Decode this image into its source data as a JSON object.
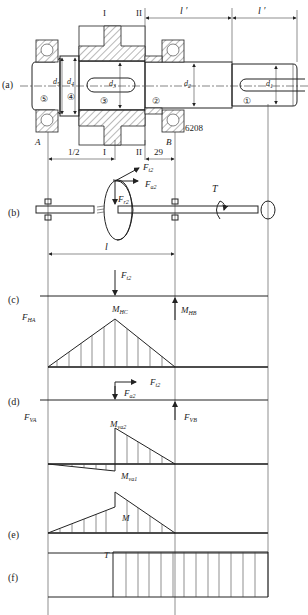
{
  "figure": {
    "panels": [
      {
        "id": "a",
        "label": "(a)"
      },
      {
        "id": "b",
        "label": "(b)"
      },
      {
        "id": "c",
        "label": "(c)"
      },
      {
        "id": "d",
        "label": "(d)"
      },
      {
        "id": "e",
        "label": "(e)"
      },
      {
        "id": "f",
        "label": "(f)"
      }
    ],
    "shaft": {
      "sections": [
        {
          "mark": "I",
          "label": "I"
        },
        {
          "mark": "II",
          "label": "II"
        }
      ],
      "segments": [
        {
          "num": "⑤",
          "dia": "d",
          "sub": "5"
        },
        {
          "num": "④",
          "dia": "d",
          "sub": "4"
        },
        {
          "num": "③",
          "dia": "d",
          "sub": "3"
        },
        {
          "num": "②",
          "dia": "d",
          "sub": "2"
        },
        {
          "num": "①",
          "dia": "d",
          "sub": "1"
        }
      ],
      "bearing_left": "A",
      "bearing_right": "B",
      "bearing_code": "6208",
      "dims": {
        "l_prime_1": "l ′",
        "l_prime_2": "l ′",
        "half_l": "1/2",
        "dist_29": "29",
        "l": "l"
      }
    },
    "forces": {
      "Ft2": {
        "main": "F",
        "sub": "t2"
      },
      "Fa2": {
        "main": "F",
        "sub": "a2"
      },
      "Fr2": {
        "main": "F",
        "sub": "r2"
      },
      "T": "T"
    },
    "horizontal_plane": {
      "reaction_A": {
        "main": "F",
        "sub": "HA"
      },
      "reaction_B": {
        "main": "M",
        "sub": "HB"
      },
      "moment_C": {
        "main": "M",
        "sub": "HC"
      },
      "load": {
        "main": "F",
        "sub": "t2"
      }
    },
    "vertical_plane": {
      "reaction_A": {
        "main": "F",
        "sub": "VA"
      },
      "reaction_B": {
        "main": "F",
        "sub": "VB"
      },
      "moment_2": {
        "main": "M",
        "sub": "va2"
      },
      "moment_1": {
        "main": "M",
        "sub": "va1"
      },
      "load_t": {
        "main": "F",
        "sub": "t2"
      },
      "load_a": {
        "main": "F",
        "sub": "a2"
      }
    },
    "combined_moment": {
      "label": "M"
    },
    "torque": {
      "label": "T"
    }
  }
}
